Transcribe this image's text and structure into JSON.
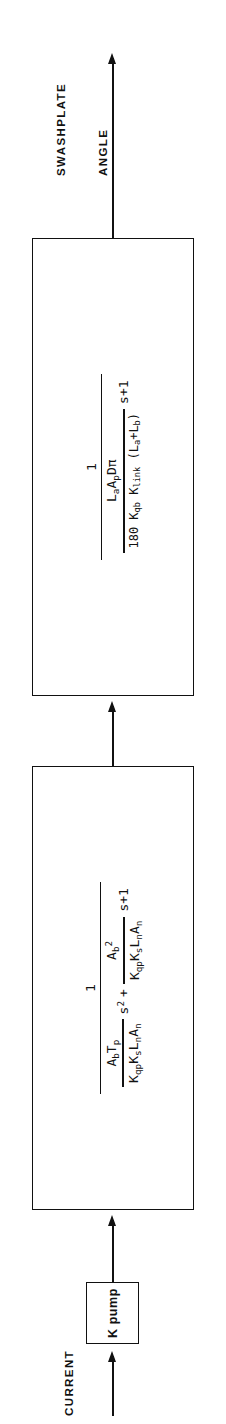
{
  "diagram": {
    "type": "control-system-block-diagram",
    "orientation": "rotated-90-ccw",
    "input_label": "CURRENT",
    "output_label": "SWASHPLATE\nANGLE",
    "output_label_line1": "SWASHPLATE",
    "output_label_line2": "ANGLE",
    "ink_color": "#111111",
    "background_color": "#ffffff"
  },
  "blocks": [
    {
      "id": "gain-block",
      "name": "K pump",
      "label": "K pump",
      "kind": "gain"
    },
    {
      "id": "pump-dynamics-block",
      "kind": "transfer-function",
      "numerator": "1",
      "denominator_terms": [
        {
          "coefficient_num": "AₑTₚ",
          "coefficient_den": "KᵠₚKₛLₙAₙ",
          "variable": "s2"
        },
        {
          "coefficient_num": "Aᵇ²",
          "coefficient_den": "KᵠₚKₛLₙAₙ",
          "variable": "s"
        },
        {
          "coefficient_num": "1",
          "coefficient_den": "",
          "variable": ""
        }
      ],
      "text": {
        "one": "1",
        "t1_num_A": "A",
        "t1_num_A_sub": "b",
        "t1_num_T": "T",
        "t1_num_T_sub": "p",
        "t1_den": "K",
        "t1_den_sub1": "qp",
        "t1_den_K2": "K",
        "t1_den_sub2": "s",
        "t1_den_L": "L",
        "t1_den_L_sub": "n",
        "t1_den_A": "A",
        "t1_den_A_sub": "n",
        "s_squared_plus": "s",
        "sup2": "2",
        "plus": "+",
        "t2_num_A": "A",
        "t2_num_A_sub": "b",
        "t2_num_sup": "2",
        "s_plus_one": "s+1"
      }
    },
    {
      "id": "swashplate-dynamics-block",
      "kind": "transfer-function",
      "numerator": "1",
      "denominator_terms": [
        {
          "coefficient_num": "LₐAₚDπ",
          "coefficient_den": "180 Kᵠᵇ Kₗᵢₙₖ (Lₐ+Lᵇ)",
          "variable": "s"
        },
        {
          "coefficient_num": "1",
          "coefficient_den": "",
          "variable": ""
        }
      ],
      "text": {
        "one": "1",
        "num_L": "L",
        "num_L_sub": "a",
        "num_A": "A",
        "num_A_sub": "p",
        "num_D": "D",
        "num_pi": "π",
        "den_180": "180",
        "den_K1": "K",
        "den_K1_sub": "qb",
        "den_K2": "K",
        "den_K2_sub": "link",
        "den_paren_open": "(",
        "den_L1": "L",
        "den_L1_sub": "a",
        "den_plus": "+",
        "den_L2": "L",
        "den_L2_sub": "b",
        "den_paren_close": ")",
        "s_plus_one": "s+1"
      }
    }
  ],
  "connections": [
    {
      "from": "input",
      "to": "gain-block",
      "label": "CURRENT",
      "arrow": true
    },
    {
      "from": "gain-block",
      "to": "pump-dynamics-block",
      "arrow": true
    },
    {
      "from": "pump-dynamics-block",
      "to": "swashplate-dynamics-block",
      "arrow": true
    },
    {
      "from": "swashplate-dynamics-block",
      "to": "output",
      "label": "SWASHPLATE ANGLE",
      "arrow": true
    }
  ]
}
